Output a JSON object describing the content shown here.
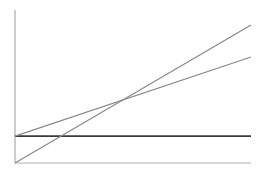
{
  "chart_data": {
    "type": "line",
    "title": "",
    "xlabel": "",
    "ylabel": "",
    "xlim": [
      0,
      10
    ],
    "ylim": [
      0,
      10
    ],
    "grid": false,
    "legend": null,
    "note": "No tick marks or labels are shown; values are normalized to the plot area (0-10 on each axis).",
    "series": [
      {
        "name": "horizontal-line",
        "color": "#3a3a3a",
        "x": [
          0,
          10
        ],
        "y": [
          1.76,
          1.76
        ]
      },
      {
        "name": "shallow-rising-line",
        "color": "#8a8a8a",
        "x": [
          0,
          10
        ],
        "y": [
          1.76,
          6.93
        ]
      },
      {
        "name": "steep-rising-line",
        "color": "#8a8a8a",
        "x": [
          0,
          10
        ],
        "y": [
          0,
          9.02
        ]
      }
    ],
    "intersections": [
      {
        "between": [
          "steep-rising-line",
          "shallow-rising-line"
        ],
        "x": 4.3,
        "y": 4.0
      },
      {
        "between": [
          "steep-rising-line",
          "horizontal-line"
        ],
        "x": 1.8,
        "y": 1.76
      }
    ]
  },
  "axes": {
    "color": "#9a9a9a"
  }
}
